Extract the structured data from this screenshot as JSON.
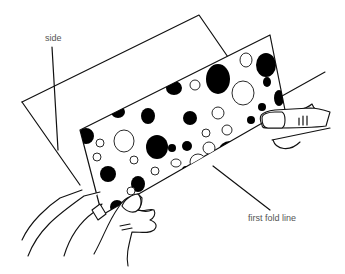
{
  "figure": {
    "labels": {
      "side": "side",
      "first_fold_line": "first fold line"
    },
    "colors": {
      "line": "#111111",
      "dot": "#000000",
      "label_text": "#555555",
      "background": "#ffffff"
    }
  }
}
